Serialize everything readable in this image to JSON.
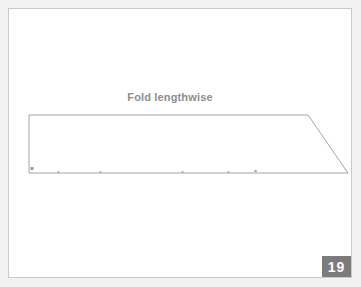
{
  "page": {
    "background_color": "#f2f2f2",
    "sheet_color": "#ffffff",
    "sheet_border_color": "#c9c9c9"
  },
  "figure": {
    "label": "Fold lengthwise",
    "label_color": "#8e8e8e",
    "outline_color": "#9a9a9a",
    "marker_color": "#9a9a9a",
    "shape_type": "trapezoid",
    "shape_points": "29,115 308,115 348,173 29,173",
    "edges": [
      {
        "name": "fold-edge-top",
        "x1": 29,
        "y1": 115,
        "x2": 308,
        "y2": 115
      },
      {
        "name": "bevel-edge-right",
        "x1": 308,
        "y1": 115,
        "x2": 348,
        "y2": 173
      },
      {
        "name": "bottom-edge",
        "x1": 348,
        "y1": 173,
        "x2": 29,
        "y2": 173
      },
      {
        "name": "left-edge",
        "x1": 29,
        "y1": 173,
        "x2": 29,
        "y2": 115
      }
    ],
    "corner_marker": {
      "x": 31,
      "y": 168,
      "size": 3
    },
    "bottom_tick_marks": [
      58,
      100,
      182,
      228,
      255
    ],
    "top_tick_marks": [
      250
    ]
  },
  "badge": {
    "number": "19",
    "background_color": "#7b7b7b",
    "text_color": "#ffffff"
  }
}
